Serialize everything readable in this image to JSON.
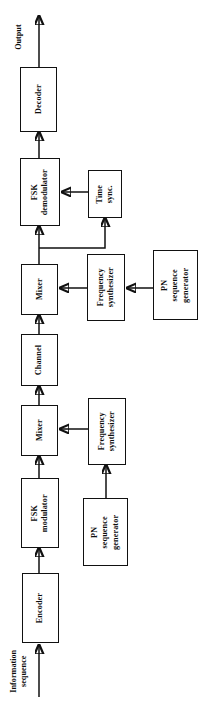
{
  "diagram": {
    "orientation": "rotated-90-ccw",
    "stroke_color": "#111111",
    "background_color": "#ffffff",
    "blocks": [
      {
        "id": "decoder",
        "label": "Decoder"
      },
      {
        "id": "fsk_demod",
        "label": "FSK\ndemodulator"
      },
      {
        "id": "time_sync",
        "label": "Time\nsync."
      },
      {
        "id": "mixer_rx",
        "label": "Mixer"
      },
      {
        "id": "freq_synth_rx",
        "label": "Frequency\nsynthesizer"
      },
      {
        "id": "pn_gen_rx",
        "label": "PN\nsequence\ngenerator"
      },
      {
        "id": "channel",
        "label": "Channel"
      },
      {
        "id": "mixer_tx",
        "label": "Mixer"
      },
      {
        "id": "freq_synth_tx",
        "label": "Frequency\nsynthesizer"
      },
      {
        "id": "fsk_mod",
        "label": "FSK\nmodulator"
      },
      {
        "id": "pn_gen_tx",
        "label": "PN\nsequence\ngenerator"
      },
      {
        "id": "encoder",
        "label": "Encoder"
      }
    ],
    "labels": {
      "output": "Output",
      "information_sequence": "Information\nsequence"
    },
    "block_text": {
      "decoder": "Decoder",
      "fsk_demod_line1": "FSK",
      "fsk_demod_line2": "demodulator",
      "time_sync_line1": "Time",
      "time_sync_line2": "sync.",
      "mixer_rx": "Mixer",
      "freq_synth_rx_line1": "Frequency",
      "freq_synth_rx_line2": "synthesizer",
      "pn_gen_rx_line1": "PN",
      "pn_gen_rx_line2": "sequence",
      "pn_gen_rx_line3": "generator",
      "channel": "Channel",
      "mixer_tx": "Mixer",
      "freq_synth_tx_line1": "Frequency",
      "freq_synth_tx_line2": "synthesizer",
      "fsk_mod_line1": "FSK",
      "fsk_mod_line2": "modulator",
      "pn_gen_tx_line1": "PN",
      "pn_gen_tx_line2": "sequence",
      "pn_gen_tx_line3": "generator",
      "encoder": "Encoder"
    }
  }
}
